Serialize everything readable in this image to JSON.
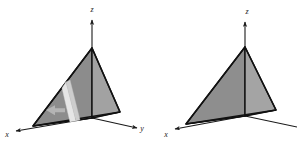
{
  "figure": {
    "type": "technical-illustration",
    "background_color": "#ffffff",
    "panels": [
      {
        "name": "left-panel",
        "label": "tetrahedron-with-cross-section",
        "axes": [
          {
            "name": "z-axis",
            "label": "z",
            "direction": "up",
            "label_x": 92,
            "label_y": 11
          },
          {
            "name": "x-axis",
            "label": "x",
            "direction": "front-left",
            "label_x": 7,
            "label_y": 134
          },
          {
            "name": "y-axis",
            "label": "y",
            "direction": "front-right",
            "label_x": 141,
            "label_y": 130
          }
        ],
        "annotations": [
          {
            "name": "cross-section-slab",
            "kind": "vertical-slice",
            "color": "#e2e2e2"
          },
          {
            "name": "direction-arrow",
            "kind": "arrow",
            "points": "left",
            "color": "#b0b0b0"
          }
        ]
      },
      {
        "name": "right-panel",
        "label": "tetrahedron-plain",
        "clipped_at_right_edge": true,
        "axes": [
          {
            "name": "z-axis",
            "label": "z",
            "direction": "up",
            "label_x": 247,
            "label_y": 13
          },
          {
            "name": "x-axis",
            "label": "x",
            "direction": "front-left",
            "label_x": 166,
            "label_y": 134
          }
        ],
        "annotations": []
      }
    ],
    "colors": {
      "outline": "#111111",
      "face_back_left": "#8c8c8c",
      "face_right": "#a0a0a0",
      "face_front_left": "#989898",
      "face_bottom": "#d4d4d4",
      "slab_front": "#e4e4e4",
      "slab_side": "#c9c9c9",
      "arrow": "#b4b4b4",
      "axis_line": "#1a1a1a",
      "label_text": "#1a1a1a"
    }
  }
}
